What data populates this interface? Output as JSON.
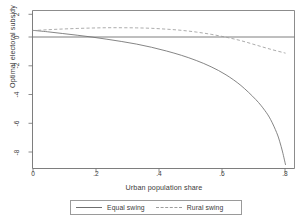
{
  "chart_data": {
    "type": "line",
    "title": "",
    "xlabel": "Urban population share",
    "ylabel": "Optimal electoral subsidy",
    "xlim": [
      0,
      0.88
    ],
    "ylim": [
      -8.6,
      2.4
    ],
    "xticks": [
      "0",
      ".2",
      ".4",
      ".6",
      ".8"
    ],
    "xtick_values": [
      0,
      0.2,
      0.4,
      0.6,
      0.8
    ],
    "yticks": [
      "2",
      "0",
      "-2",
      "-4",
      "-6",
      "-8"
    ],
    "ytick_values": [
      2,
      0,
      -2,
      -4,
      -6,
      -8
    ],
    "grid": false,
    "legend_position": "below-axis",
    "reference_lines": [
      {
        "axis": "y",
        "value": 0
      }
    ],
    "series": [
      {
        "name": "Equal swing",
        "style": "solid",
        "color": "#6f6f6f",
        "x": [
          0.0,
          0.05,
          0.1,
          0.15,
          0.2,
          0.25,
          0.3,
          0.35,
          0.4,
          0.45,
          0.5,
          0.55,
          0.6,
          0.65,
          0.7,
          0.75,
          0.78,
          0.8,
          0.82,
          0.83,
          0.84,
          0.85
        ],
        "y": [
          1.02,
          0.92,
          0.8,
          0.68,
          0.55,
          0.4,
          0.24,
          0.06,
          -0.16,
          -0.42,
          -0.72,
          -1.08,
          -1.52,
          -2.08,
          -2.82,
          -3.8,
          -4.55,
          -5.2,
          -6.1,
          -6.7,
          -7.45,
          -8.35
        ]
      },
      {
        "name": "Rural swing",
        "style": "dashed",
        "color": "#9d9d9d",
        "x": [
          0.0,
          0.05,
          0.1,
          0.15,
          0.2,
          0.25,
          0.3,
          0.35,
          0.4,
          0.45,
          0.5,
          0.55,
          0.6,
          0.65,
          0.7,
          0.75,
          0.8,
          0.85
        ],
        "y": [
          1.0,
          1.06,
          1.11,
          1.15,
          1.18,
          1.2,
          1.2,
          1.19,
          1.16,
          1.1,
          1.02,
          0.9,
          0.74,
          0.54,
          0.3,
          0.0,
          -0.3,
          -0.57
        ]
      }
    ]
  },
  "legend": {
    "entries": [
      {
        "label": "Equal swing",
        "style": "solid"
      },
      {
        "label": "Rural swing",
        "style": "dashed"
      }
    ]
  },
  "colors": {
    "axis": "#6f6f6f",
    "text": "#3b3b3b",
    "equal_swing": "#6f6f6f",
    "rural_swing": "#9d9d9d",
    "zero_line": "#6f6f6f",
    "background": "#ffffff"
  }
}
